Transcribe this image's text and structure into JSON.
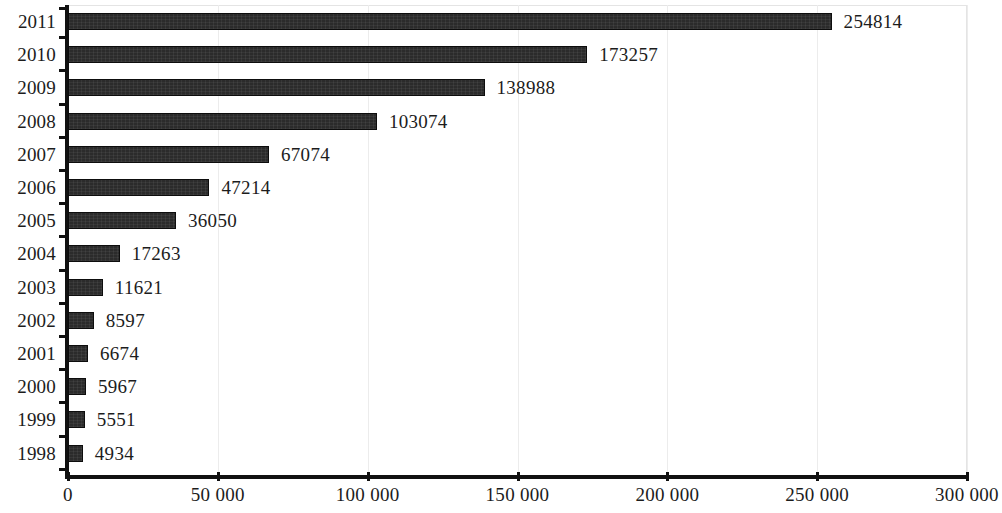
{
  "chart_data": {
    "type": "bar",
    "orientation": "horizontal",
    "title": "",
    "subtitle": "",
    "xlabel": "",
    "ylabel": "",
    "grid": true,
    "legend": null,
    "xlim": [
      0,
      300000
    ],
    "xticks": [
      0,
      50000,
      100000,
      150000,
      200000,
      250000,
      300000
    ],
    "xtick_labels": [
      "0",
      "50 000",
      "100 000",
      "150 000",
      "200 000",
      "250 000",
      "300 000"
    ],
    "categories": [
      "2011",
      "2010",
      "2009",
      "2008",
      "2007",
      "2006",
      "2005",
      "2004",
      "2003",
      "2002",
      "2001",
      "2000",
      "1999",
      "1998"
    ],
    "values": [
      254814,
      173257,
      138988,
      103074,
      67074,
      47214,
      36050,
      17263,
      11621,
      8597,
      6674,
      5967,
      5551,
      4934
    ],
    "data_labels": [
      "254814",
      "173257",
      "138988",
      "103074",
      "67074",
      "47214",
      "36050",
      "17263",
      "11621",
      "8597",
      "6674",
      "5967",
      "5551",
      "4934"
    ],
    "bar_color": "#2b2b2b",
    "bar_edge_color": "#0d0d0d",
    "gridline_color": "#ececec",
    "axis_color": "#111111",
    "background_color": "#ffffff"
  }
}
